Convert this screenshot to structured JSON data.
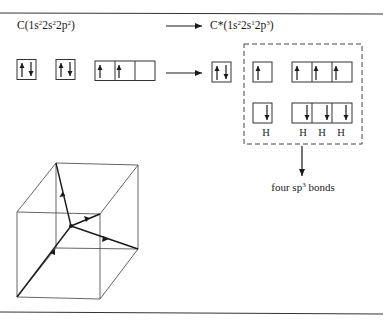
{
  "ground_state": {
    "label": "C(1s",
    "parts": [
      {
        "text": "C(1s"
      },
      {
        "sup": "2"
      },
      {
        "text": "2s"
      },
      {
        "sup": "2"
      },
      {
        "text": "2p"
      },
      {
        "sup": "2"
      },
      {
        "text": ")"
      }
    ],
    "orbitals": {
      "1s": [
        "up",
        "down"
      ],
      "2s": [
        "up",
        "down"
      ],
      "2p": [
        [
          "up"
        ],
        [
          "up"
        ],
        []
      ]
    }
  },
  "excited_state": {
    "parts": [
      {
        "text": "C*(1s"
      },
      {
        "sup": "2"
      },
      {
        "text": "2s"
      },
      {
        "sup": "1"
      },
      {
        "text": "2p"
      },
      {
        "sup": "3"
      },
      {
        "text": ")"
      }
    ],
    "orbitals": {
      "1s": [
        "up",
        "down"
      ],
      "2s": [
        "up"
      ],
      "2p": [
        [
          "up"
        ],
        [
          "up"
        ],
        [
          "up"
        ]
      ]
    }
  },
  "bonding": {
    "hydrogen_label": "H",
    "hydrogen_count": 4,
    "result_label_pre": "four sp",
    "result_label_sup": "3",
    "result_label_post": " bonds"
  },
  "colors": {
    "ink": "#1a1a1a",
    "cube_line": "#555555",
    "background": "#ffffff"
  }
}
